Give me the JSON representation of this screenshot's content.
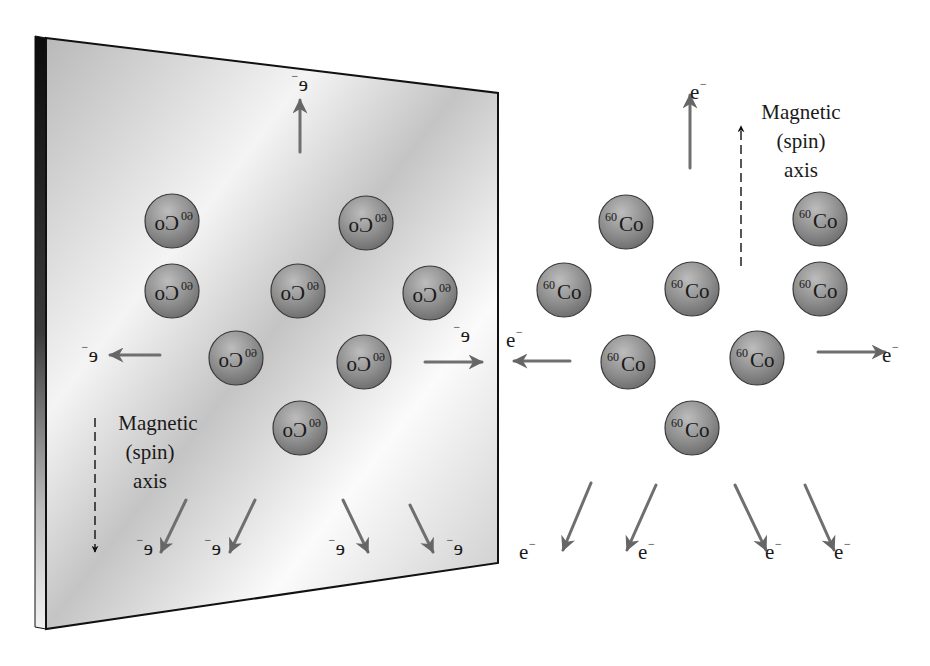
{
  "diagram": {
    "nucleus_label": {
      "mass_number": "60",
      "symbol": "Co"
    },
    "electron_label": {
      "base": "e",
      "charge": "−"
    },
    "axis_label": {
      "line1": "Magnetic",
      "line2": "(spin)",
      "line3": "axis"
    },
    "colors": {
      "sphere_fill": "#8a8a8a",
      "sphere_highlight": "#bdbdbd",
      "sphere_stroke": "#3a3a3a",
      "arrow": "#6f6f6f",
      "mirror_surface": "#cfcfcf",
      "mirror_edge": "#111111",
      "text": "#1a1a1a"
    },
    "mirror": {
      "description": "Mirror panel on the left showing the reflected (mirror-image) experiment; text appears horizontally flipped",
      "corners": {
        "top_left": [
          35,
          36
        ],
        "top_right": [
          498,
          93
        ],
        "bottom_right": [
          498,
          563
        ],
        "bottom_left": [
          35,
          627
        ]
      },
      "axis_direction": "down",
      "nuclei": [
        {
          "cx": 172,
          "cy": 221
        },
        {
          "cx": 366,
          "cy": 223
        },
        {
          "cx": 172,
          "cy": 291
        },
        {
          "cx": 298,
          "cy": 291
        },
        {
          "cx": 430,
          "cy": 293
        },
        {
          "cx": 236,
          "cy": 358
        },
        {
          "cx": 364,
          "cy": 362
        },
        {
          "cx": 300,
          "cy": 428
        }
      ],
      "electrons": [
        {
          "direction": "up",
          "from": [
            300,
            152
          ],
          "to": [
            300,
            100
          ],
          "label_at": [
            300,
            84
          ]
        },
        {
          "direction": "left",
          "from": [
            160,
            355
          ],
          "to": [
            110,
            355
          ],
          "label_at": [
            90,
            355
          ]
        },
        {
          "direction": "right",
          "from": [
            425,
            362
          ],
          "to": [
            482,
            362
          ],
          "label_at": [
            462,
            335
          ]
        },
        {
          "direction": "down-left",
          "from": [
            186,
            500
          ],
          "to": [
            161,
            552
          ],
          "label_at": [
            145,
            548
          ]
        },
        {
          "direction": "down-left",
          "from": [
            255,
            500
          ],
          "to": [
            230,
            552
          ],
          "label_at": [
            213,
            548
          ]
        },
        {
          "direction": "down-right",
          "from": [
            343,
            500
          ],
          "to": [
            368,
            552
          ],
          "label_at": [
            337,
            548
          ]
        },
        {
          "direction": "down-right",
          "from": [
            410,
            505
          ],
          "to": [
            433,
            552
          ],
          "label_at": [
            455,
            548
          ]
        }
      ]
    },
    "real": {
      "description": "Actual experiment on the right; nuclei spins aligned up, electrons preferentially emitted opposite to spin (downward)",
      "axis_direction": "up",
      "nuclei": [
        {
          "cx": 626,
          "cy": 222
        },
        {
          "cx": 820,
          "cy": 219
        },
        {
          "cx": 564,
          "cy": 290
        },
        {
          "cx": 692,
          "cy": 289
        },
        {
          "cx": 820,
          "cy": 289
        },
        {
          "cx": 628,
          "cy": 362
        },
        {
          "cx": 757,
          "cy": 358
        },
        {
          "cx": 692,
          "cy": 428
        }
      ],
      "electrons": [
        {
          "direction": "up",
          "from": [
            690,
            168
          ],
          "to": [
            690,
            95
          ],
          "label_at": [
            698,
            92
          ]
        },
        {
          "direction": "left",
          "from": [
            570,
            361
          ],
          "to": [
            514,
            361
          ],
          "label_at": [
            514,
            340
          ]
        },
        {
          "direction": "right",
          "from": [
            818,
            352
          ],
          "to": [
            885,
            352
          ],
          "label_at": [
            890,
            355
          ]
        },
        {
          "direction": "down-left",
          "from": [
            591,
            483
          ],
          "to": [
            563,
            550
          ],
          "label_at": [
            527,
            552
          ]
        },
        {
          "direction": "down-left",
          "from": [
            656,
            485
          ],
          "to": [
            627,
            550
          ],
          "label_at": [
            646,
            552
          ]
        },
        {
          "direction": "down-right",
          "from": [
            735,
            485
          ],
          "to": [
            766,
            550
          ],
          "label_at": [
            773,
            552
          ]
        },
        {
          "direction": "down-right",
          "from": [
            805,
            485
          ],
          "to": [
            834,
            550
          ],
          "label_at": [
            842,
            552
          ]
        }
      ]
    }
  }
}
